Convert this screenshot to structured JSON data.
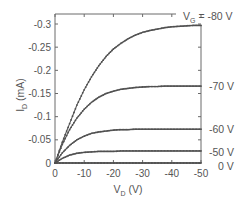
{
  "chart_data": {
    "type": "line",
    "title": "",
    "xlabel": "V_D (V)",
    "ylabel": "I_D (mA)",
    "xlim": [
      0,
      -50
    ],
    "ylim": [
      0,
      -0.3
    ],
    "grid": false,
    "legend_position": "right-inline",
    "x_ticks": [
      "0",
      "-10",
      "-20",
      "-30",
      "-40",
      "-50"
    ],
    "y_ticks": [
      "0",
      "-0.05",
      "-0.1",
      "-0.15",
      "-0.2",
      "-0.25",
      "-0.3"
    ],
    "x": [
      0,
      -2.5,
      -5,
      -7.5,
      -10,
      -12.5,
      -15,
      -17.5,
      -20,
      -22.5,
      -25,
      -27.5,
      -30,
      -32.5,
      -35,
      -37.5,
      -40,
      -42.5,
      -45,
      -47.5,
      -50
    ],
    "series": [
      {
        "name": "V_G = -80 V",
        "label": "V_G = -80 V",
        "values": [
          0,
          -0.045,
          -0.085,
          -0.125,
          -0.158,
          -0.186,
          -0.21,
          -0.23,
          -0.246,
          -0.258,
          -0.268,
          -0.276,
          -0.282,
          -0.286,
          -0.289,
          -0.292,
          -0.294,
          -0.295,
          -0.296,
          -0.297,
          -0.297
        ]
      },
      {
        "name": "V_G = -70 V",
        "label": "-70 V",
        "values": [
          0,
          -0.04,
          -0.072,
          -0.097,
          -0.116,
          -0.131,
          -0.142,
          -0.15,
          -0.155,
          -0.159,
          -0.161,
          -0.163,
          -0.164,
          -0.165,
          -0.165,
          -0.166,
          -0.166,
          -0.166,
          -0.166,
          -0.166,
          -0.166
        ]
      },
      {
        "name": "V_G = -60 V",
        "label": "-60 V",
        "values": [
          0,
          -0.022,
          -0.038,
          -0.05,
          -0.058,
          -0.064,
          -0.067,
          -0.069,
          -0.071,
          -0.072,
          -0.072,
          -0.073,
          -0.073,
          -0.073,
          -0.073,
          -0.073,
          -0.073,
          -0.073,
          -0.073,
          -0.073,
          -0.073
        ]
      },
      {
        "name": "V_G = -50 V",
        "label": "-50 V",
        "values": [
          0,
          -0.01,
          -0.017,
          -0.021,
          -0.023,
          -0.024,
          -0.025,
          -0.025,
          -0.025,
          -0.026,
          -0.026,
          -0.026,
          -0.026,
          -0.026,
          -0.026,
          -0.026,
          -0.026,
          -0.026,
          -0.026,
          -0.026,
          -0.026
        ]
      },
      {
        "name": "V_G = 0 V",
        "label": "0 V",
        "values": [
          0,
          0,
          0,
          0,
          0,
          0,
          0,
          0,
          0,
          0,
          0,
          0,
          0,
          0,
          0,
          0,
          0,
          0,
          0,
          0,
          0
        ]
      }
    ],
    "colors": {
      "line": "#5a5a5a",
      "marker": "#505050",
      "axis": "#6a6a6a",
      "text": "#555555"
    }
  },
  "labels": {
    "ylabel_main": "I",
    "ylabel_sub": "D",
    "ylabel_unit": " (mA)",
    "xlabel_main": "V",
    "xlabel_sub": "D",
    "xlabel_unit": " (V)",
    "vg_main": "V",
    "vg_sub": "G",
    "vg_rest": " = -80 V",
    "s70": "-70 V",
    "s60": "-60 V",
    "s50": "-50 V",
    "s0": "0 V"
  }
}
